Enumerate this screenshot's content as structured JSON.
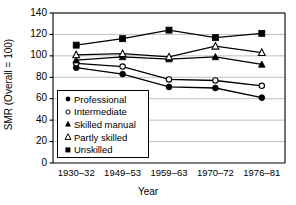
{
  "chart_data": {
    "type": "line",
    "title": "",
    "xlabel": "Year",
    "ylabel": "SMR (Overall = 100)",
    "categories": [
      "1930–32",
      "1949–53",
      "1959–63",
      "1970–72",
      "1976–81"
    ],
    "ylim": [
      0,
      140
    ],
    "yticks": [
      0,
      20,
      40,
      60,
      80,
      100,
      120,
      140
    ],
    "grid": true,
    "legend_position": "inside-lower-left",
    "series": [
      {
        "name": "Professional",
        "marker": "filled-circle",
        "values": [
          89,
          83,
          71,
          70,
          61
        ]
      },
      {
        "name": "Intermediate",
        "marker": "open-circle",
        "values": [
          93,
          90,
          78,
          77,
          72
        ]
      },
      {
        "name": "Skilled manual",
        "marker": "filled-triangle",
        "values": [
          96,
          99,
          97,
          99,
          92
        ]
      },
      {
        "name": "Partly skilled",
        "marker": "open-triangle",
        "values": [
          101,
          102,
          99,
          109,
          103
        ]
      },
      {
        "name": "Unskilled",
        "marker": "filled-square",
        "values": [
          110,
          116,
          124,
          117,
          121
        ]
      }
    ]
  },
  "colors": {
    "line": "#000000",
    "axis": "#000000",
    "grid": "#b0b0b0",
    "background": "#ffffff"
  }
}
